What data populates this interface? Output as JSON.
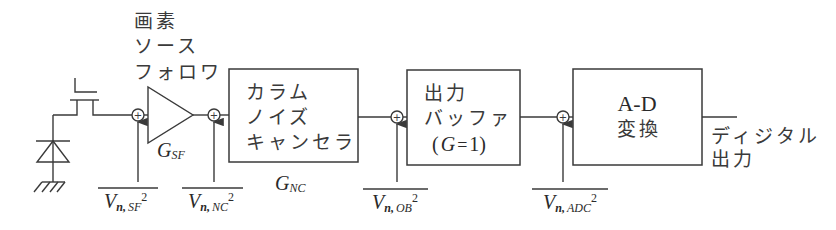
{
  "diagram": {
    "source_follower_label": [
      "画素",
      "ソース",
      "フォロワ"
    ],
    "source_follower_gain": {
      "symbol": "G",
      "subscript": "SF"
    },
    "column_noise_canceller": {
      "lines": [
        "カラム",
        "ノイズ",
        "キャンセラ"
      ],
      "gain": {
        "symbol": "G",
        "subscript": "NC"
      }
    },
    "output_buffer": {
      "lines": [
        "出力",
        "バッファ"
      ],
      "gain_note": {
        "open": "(",
        "symbol": "G",
        "eq": "=",
        "value": "1",
        "close": ")"
      }
    },
    "adc": {
      "lines": [
        "A-D",
        "変換"
      ]
    },
    "digital_output_label": [
      "ディジタル",
      "出力"
    ],
    "summing_symbol": "+",
    "noise_sources": [
      {
        "name": "V",
        "sub_n": "n,",
        "sub": "SF",
        "power": "2"
      },
      {
        "name": "V",
        "sub_n": "n,",
        "sub": "NC",
        "power": "2"
      },
      {
        "name": "V",
        "sub_n": "n,",
        "sub": "OB",
        "power": "2"
      },
      {
        "name": "V",
        "sub_n": "n,",
        "sub": "ADC",
        "power": "2"
      }
    ]
  }
}
